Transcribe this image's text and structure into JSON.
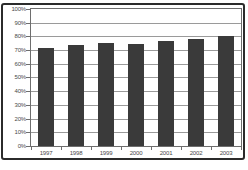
{
  "chart_data": {
    "type": "bar",
    "title": "",
    "xlabel": "",
    "ylabel": "",
    "categories": [
      "1997",
      "1998",
      "1999",
      "2000",
      "2001",
      "2002",
      "2003"
    ],
    "values": [
      71.5,
      73.5,
      75,
      74.5,
      76.5,
      78,
      80.5
    ],
    "ylim": [
      0,
      100
    ],
    "ytick_step": 10,
    "ytick_labels": [
      "0%",
      "10%",
      "20%",
      "30%",
      "40%",
      "50%",
      "60%",
      "70%",
      "80%",
      "90%",
      "100%"
    ],
    "grid": true,
    "legend": false,
    "bar_color": "#3a3a3a",
    "gridline_color": "#9a9a9a",
    "axis_color": "#6e6e6e",
    "frame_color": "#2b2b2b",
    "label_color": "#4a4a4a",
    "background": "#ffffff"
  }
}
